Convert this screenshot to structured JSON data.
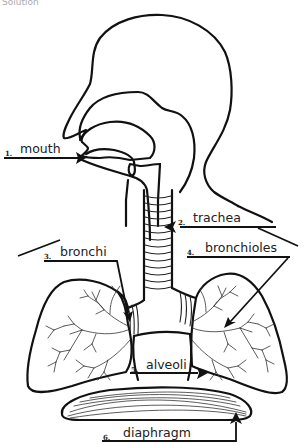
{
  "diagram": {
    "caption_cut": "Solution",
    "labels": [
      {
        "number": "1.",
        "text": "mouth"
      },
      {
        "number": "2.",
        "text": "trachea"
      },
      {
        "number": "3.",
        "text": "bronchi"
      },
      {
        "number": "4.",
        "text": "bronchioles"
      },
      {
        "number": "5.",
        "text": "alveoli"
      },
      {
        "number": "6.",
        "text": "diaphragm"
      }
    ],
    "colors": {
      "line": "#111111",
      "background": "#ffffff"
    }
  }
}
